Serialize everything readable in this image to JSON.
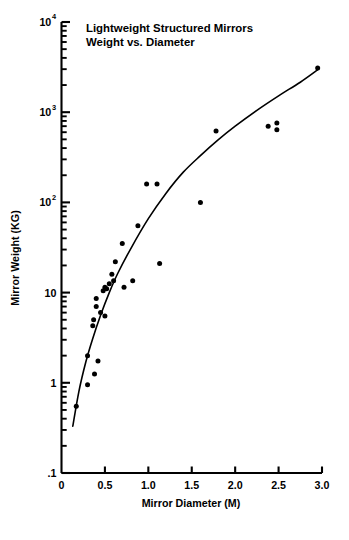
{
  "chart_data": {
    "type": "scatter",
    "title": "Lightweight Structured Mirrors",
    "subtitle": "Weight vs. Diameter",
    "xlabel": "Mirror Diameter (M)",
    "ylabel": "Mirror Weight (KG)",
    "xlim": [
      0,
      3.0
    ],
    "ylim": [
      0.1,
      10000
    ],
    "yscale": "log",
    "xscale": "linear",
    "grid": false,
    "legend": "none",
    "xticks": [
      0,
      0.5,
      1.0,
      1.5,
      2.0,
      2.5,
      3.0
    ],
    "xtick_labels": [
      "0",
      "0.5",
      "1.0",
      "1.5",
      "2.0",
      "2.5",
      "3.0"
    ],
    "yticks": [
      0.1,
      1,
      10,
      100,
      1000,
      10000
    ],
    "ytick_labels": [
      ".1",
      "1",
      "10",
      "10^2",
      "10^3",
      "10^4"
    ],
    "ytick_mantissa": [
      ".1",
      "1",
      "10",
      "10",
      "10",
      "10"
    ],
    "ytick_exponent": [
      "",
      "",
      "",
      "2",
      "3",
      "4"
    ],
    "series": [
      {
        "name": "Mirrors",
        "marker": "filled-circle",
        "color": "#000000",
        "points": [
          {
            "x": 0.17,
            "y": 0.55
          },
          {
            "x": 0.3,
            "y": 0.95
          },
          {
            "x": 0.38,
            "y": 1.25
          },
          {
            "x": 0.3,
            "y": 2.0
          },
          {
            "x": 0.42,
            "y": 1.75
          },
          {
            "x": 0.36,
            "y": 4.3
          },
          {
            "x": 0.37,
            "y": 5.0
          },
          {
            "x": 0.4,
            "y": 7.0
          },
          {
            "x": 0.4,
            "y": 8.6
          },
          {
            "x": 0.45,
            "y": 6.0
          },
          {
            "x": 0.48,
            "y": 10.5
          },
          {
            "x": 0.5,
            "y": 11.5
          },
          {
            "x": 0.52,
            "y": 11.0
          },
          {
            "x": 0.55,
            "y": 12.5
          },
          {
            "x": 0.5,
            "y": 5.5
          },
          {
            "x": 0.58,
            "y": 16.0
          },
          {
            "x": 0.62,
            "y": 22.0
          },
          {
            "x": 0.6,
            "y": 13.5
          },
          {
            "x": 0.72,
            "y": 11.5
          },
          {
            "x": 0.7,
            "y": 35.0
          },
          {
            "x": 0.82,
            "y": 13.5
          },
          {
            "x": 0.88,
            "y": 55.0
          },
          {
            "x": 0.98,
            "y": 160.0
          },
          {
            "x": 1.1,
            "y": 160.0
          },
          {
            "x": 1.13,
            "y": 21.0
          },
          {
            "x": 1.6,
            "y": 100.0
          },
          {
            "x": 1.78,
            "y": 620.0
          },
          {
            "x": 2.38,
            "y": 700.0
          },
          {
            "x": 2.48,
            "y": 760.0
          },
          {
            "x": 2.48,
            "y": 640.0
          },
          {
            "x": 2.95,
            "y": 3100.0
          }
        ]
      }
    ],
    "fit_curve": {
      "name": "trend-line",
      "description": "smooth monotonic fit through the data",
      "points": [
        {
          "x": 0.13,
          "y": 0.33
        },
        {
          "x": 0.2,
          "y": 0.8
        },
        {
          "x": 0.28,
          "y": 1.7
        },
        {
          "x": 0.36,
          "y": 3.1
        },
        {
          "x": 0.45,
          "y": 5.6
        },
        {
          "x": 0.55,
          "y": 10.0
        },
        {
          "x": 0.65,
          "y": 16.5
        },
        {
          "x": 0.8,
          "y": 31.0
        },
        {
          "x": 1.0,
          "y": 66.0
        },
        {
          "x": 1.2,
          "y": 125.0
        },
        {
          "x": 1.4,
          "y": 215.0
        },
        {
          "x": 1.6,
          "y": 330.0
        },
        {
          "x": 1.8,
          "y": 490.0
        },
        {
          "x": 2.0,
          "y": 700.0
        },
        {
          "x": 2.25,
          "y": 1050.0
        },
        {
          "x": 2.5,
          "y": 1520.0
        },
        {
          "x": 2.75,
          "y": 2150.0
        },
        {
          "x": 2.95,
          "y": 2950.0
        }
      ]
    }
  },
  "axes": {
    "y_label": "Mirror Weight (KG)",
    "x_label": "Mirror Diameter (M)"
  },
  "title": {
    "line1": "Lightweight Structured Mirrors",
    "line2": "Weight vs. Diameter"
  }
}
